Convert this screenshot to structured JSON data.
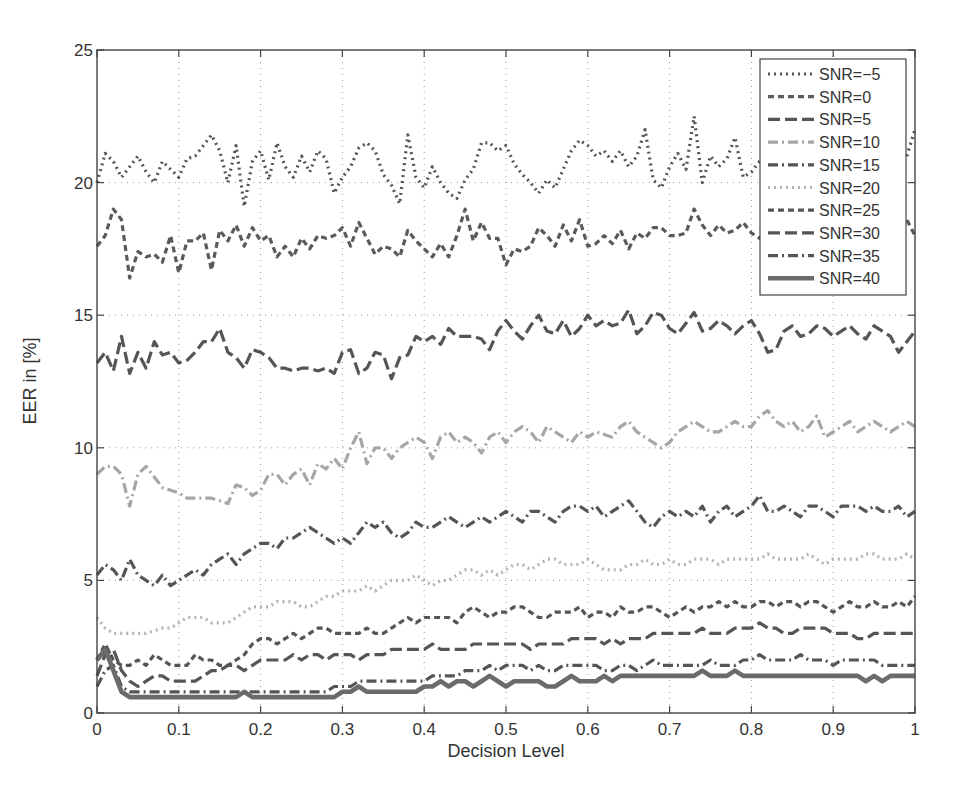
{
  "chart_data": {
    "type": "line",
    "title": "",
    "xlabel": "Decision Level",
    "ylabel": "EER in [%]",
    "xlim": [
      0,
      1
    ],
    "ylim": [
      0,
      25
    ],
    "xticks": [
      0,
      0.1,
      0.2,
      0.3,
      0.4,
      0.5,
      0.6,
      0.7,
      0.8,
      0.9,
      1
    ],
    "xtick_labels": [
      "0",
      "0.1",
      "0.2",
      "0.3",
      "0.4",
      "0.5",
      "0.6",
      "0.7",
      "0.8",
      "0.9",
      "1"
    ],
    "yticks": [
      0,
      5,
      10,
      15,
      20,
      25
    ],
    "ytick_labels": [
      "0",
      "5",
      "10",
      "15",
      "20",
      "25"
    ],
    "grid": true,
    "grid_style": "dotted",
    "legend_position": "upper right",
    "x_step": 0.01,
    "series": [
      {
        "name": "SNR=-5",
        "label": "SNR=−5",
        "color": "#555555",
        "width": 3.2,
        "dash": "2 4",
        "values": [
          20.0,
          21.1,
          20.8,
          20.2,
          20.6,
          21.0,
          20.4,
          20.0,
          20.8,
          20.5,
          20.2,
          20.9,
          21.0,
          21.4,
          21.8,
          21.2,
          20.0,
          21.4,
          19.1,
          20.8,
          21.2,
          20.1,
          21.5,
          20.6,
          20.2,
          21.0,
          20.4,
          21.2,
          20.9,
          19.6,
          20.2,
          20.6,
          21.3,
          21.5,
          21.2,
          20.3,
          19.9,
          19.2,
          21.8,
          20.2,
          19.8,
          20.6,
          20.0,
          19.6,
          19.4,
          20.1,
          20.5,
          21.5,
          21.5,
          21.2,
          21.4,
          20.7,
          20.3,
          20.0,
          19.6,
          20.1,
          19.8,
          20.5,
          21.2,
          21.6,
          21.4,
          21.0,
          21.2,
          20.8,
          21.2,
          20.6,
          21.0,
          22.0,
          20.1,
          19.8,
          20.6,
          21.1,
          20.5,
          22.5,
          20.0,
          21.0,
          20.6,
          20.9,
          21.7,
          20.2,
          20.4,
          20.8,
          21.0,
          20.2,
          19.8,
          21.2,
          20.6,
          20.0,
          21.5,
          20.4,
          20.6,
          20.2,
          21.3,
          20.5,
          19.8,
          20.2,
          21.0,
          20.8,
          20.4,
          21.0,
          22.0
        ]
      },
      {
        "name": "SNR=0",
        "label": "SNR=0",
        "color": "#5a5a5a",
        "width": 3.2,
        "dash": "6 4",
        "values": [
          17.6,
          18.0,
          19.0,
          18.6,
          16.4,
          17.4,
          17.2,
          17.3,
          17.0,
          18.0,
          16.6,
          17.8,
          17.8,
          18.1,
          16.7,
          18.2,
          17.8,
          18.4,
          17.6,
          18.3,
          17.8,
          18.0,
          17.2,
          17.6,
          17.2,
          17.9,
          17.5,
          18.0,
          17.9,
          18.0,
          18.3,
          17.6,
          18.5,
          17.9,
          17.3,
          17.6,
          17.5,
          17.2,
          18.2,
          17.8,
          17.5,
          17.2,
          17.7,
          17.2,
          18.0,
          19.0,
          17.8,
          18.5,
          17.9,
          17.9,
          16.9,
          17.5,
          17.4,
          17.6,
          18.3,
          18.0,
          17.6,
          18.4,
          17.8,
          18.6,
          17.6,
          17.7,
          18.0,
          17.7,
          18.2,
          17.5,
          18.1,
          17.9,
          18.3,
          18.3,
          18.0,
          18.0,
          18.1,
          19.0,
          18.4,
          18.0,
          18.4,
          18.1,
          18.2,
          18.5,
          18.1,
          17.9,
          18.3,
          18.6,
          18.0,
          17.6,
          18.0,
          18.2,
          17.5,
          18.6,
          18.1,
          17.8,
          18.2,
          18.0,
          17.6,
          18.0,
          18.4,
          18.2,
          18.0,
          18.6,
          18.0
        ]
      },
      {
        "name": "SNR=5",
        "label": "SNR=5",
        "color": "#555555",
        "width": 3.2,
        "dash": "12 5",
        "values": [
          13.2,
          13.6,
          12.9,
          14.2,
          12.8,
          13.6,
          13.0,
          14.0,
          13.5,
          13.6,
          13.2,
          13.3,
          13.6,
          14.0,
          14.0,
          14.5,
          13.6,
          13.4,
          13.0,
          13.7,
          13.6,
          13.4,
          13.0,
          13.0,
          12.9,
          13.0,
          13.0,
          12.9,
          13.0,
          12.8,
          13.6,
          13.7,
          12.8,
          13.0,
          13.6,
          13.5,
          12.6,
          13.4,
          13.5,
          14.2,
          14.0,
          14.2,
          13.9,
          14.5,
          14.2,
          14.2,
          14.2,
          14.1,
          13.7,
          14.4,
          14.8,
          14.4,
          14.1,
          14.6,
          15.0,
          14.4,
          14.3,
          14.8,
          14.2,
          14.5,
          15.0,
          14.6,
          14.8,
          14.6,
          14.7,
          15.2,
          14.3,
          14.6,
          15.1,
          15.0,
          14.5,
          14.3,
          14.7,
          15.1,
          14.4,
          14.5,
          14.8,
          14.6,
          14.3,
          14.6,
          14.8,
          14.3,
          13.6,
          13.7,
          14.4,
          14.6,
          14.2,
          14.3,
          14.6,
          14.5,
          14.2,
          14.4,
          14.6,
          14.3,
          14.1,
          14.6,
          14.4,
          14.2,
          13.6,
          14.0,
          14.4
        ]
      },
      {
        "name": "SNR=10",
        "label": "SNR=10",
        "color": "#a6a6a6",
        "width": 3.2,
        "dash": "10 4 2 4",
        "values": [
          9.0,
          9.3,
          9.3,
          9.0,
          7.8,
          9.0,
          9.3,
          8.9,
          8.5,
          8.4,
          8.3,
          8.1,
          8.1,
          8.1,
          8.1,
          8.0,
          7.9,
          8.6,
          8.5,
          8.2,
          8.4,
          9.0,
          9.0,
          8.6,
          9.0,
          9.2,
          8.6,
          9.4,
          9.2,
          9.6,
          9.2,
          10.0,
          10.6,
          9.4,
          10.0,
          10.0,
          9.6,
          10.0,
          10.2,
          10.4,
          10.2,
          9.6,
          10.4,
          10.6,
          10.2,
          10.4,
          10.2,
          9.8,
          10.4,
          10.6,
          10.2,
          10.6,
          10.8,
          10.6,
          10.2,
          10.8,
          10.6,
          10.4,
          10.2,
          10.6,
          10.4,
          10.6,
          10.5,
          10.4,
          10.8,
          11.0,
          10.6,
          10.4,
          10.2,
          10.0,
          10.2,
          10.6,
          10.8,
          11.0,
          10.8,
          10.6,
          10.6,
          10.8,
          11.0,
          10.8,
          10.8,
          11.2,
          11.4,
          11.0,
          10.8,
          11.0,
          10.6,
          10.8,
          11.2,
          10.4,
          10.6,
          10.8,
          11.0,
          10.6,
          10.8,
          11.0,
          10.8,
          10.6,
          10.8,
          11.0,
          10.8
        ]
      },
      {
        "name": "SNR=15",
        "label": "SNR=15",
        "color": "#555555",
        "width": 3.2,
        "dash": "10 4 2 4",
        "values": [
          5.2,
          5.6,
          5.4,
          5.0,
          5.8,
          5.2,
          5.0,
          4.8,
          5.2,
          4.8,
          5.0,
          5.2,
          5.4,
          5.2,
          5.6,
          5.8,
          6.0,
          5.6,
          6.0,
          6.2,
          6.4,
          6.4,
          6.2,
          6.6,
          6.6,
          6.8,
          7.0,
          6.8,
          6.6,
          6.4,
          6.6,
          6.4,
          6.8,
          7.2,
          7.0,
          7.2,
          6.8,
          6.6,
          6.8,
          7.2,
          7.0,
          7.0,
          7.2,
          7.4,
          7.2,
          7.0,
          7.2,
          7.4,
          7.2,
          7.4,
          7.6,
          7.4,
          7.2,
          7.6,
          7.6,
          7.4,
          7.2,
          7.6,
          7.8,
          7.8,
          7.6,
          7.8,
          7.4,
          7.6,
          7.8,
          8.0,
          7.6,
          7.2,
          7.0,
          7.4,
          7.6,
          7.4,
          7.6,
          7.4,
          7.8,
          7.2,
          7.6,
          7.8,
          7.4,
          7.6,
          7.8,
          8.2,
          7.6,
          7.6,
          7.8,
          7.6,
          7.4,
          7.8,
          7.8,
          7.6,
          7.4,
          7.8,
          7.8,
          7.8,
          7.6,
          7.8,
          7.6,
          7.6,
          7.8,
          7.4,
          7.6
        ]
      },
      {
        "name": "SNR=20",
        "label": "SNR=20",
        "color": "#b3b3b3",
        "width": 3.2,
        "dash": "2 4",
        "values": [
          3.6,
          3.2,
          3.0,
          3.0,
          3.0,
          3.0,
          3.0,
          3.1,
          3.2,
          3.2,
          3.4,
          3.6,
          3.6,
          3.6,
          3.4,
          3.4,
          3.4,
          3.6,
          3.8,
          4.0,
          4.0,
          4.0,
          4.2,
          4.2,
          4.2,
          4.0,
          4.0,
          4.2,
          4.4,
          4.4,
          4.6,
          4.6,
          4.6,
          4.8,
          4.6,
          4.8,
          5.0,
          5.0,
          5.0,
          5.2,
          5.0,
          4.8,
          5.0,
          5.0,
          5.2,
          5.4,
          5.4,
          5.2,
          5.4,
          5.2,
          5.4,
          5.6,
          5.6,
          5.4,
          5.6,
          5.8,
          5.8,
          5.6,
          5.6,
          5.6,
          5.8,
          5.6,
          5.4,
          5.4,
          5.4,
          5.6,
          5.6,
          5.8,
          5.6,
          5.6,
          5.8,
          5.6,
          5.6,
          5.8,
          5.8,
          5.8,
          5.6,
          5.8,
          5.8,
          5.8,
          5.8,
          5.8,
          6.0,
          5.8,
          5.8,
          5.8,
          5.8,
          6.0,
          5.8,
          5.6,
          5.8,
          5.8,
          5.8,
          5.8,
          6.0,
          6.0,
          5.8,
          5.8,
          5.8,
          6.0,
          5.8
        ]
      },
      {
        "name": "SNR=25",
        "label": "SNR=25",
        "color": "#555555",
        "width": 3.2,
        "dash": "6 4",
        "values": [
          2.0,
          2.6,
          2.0,
          1.8,
          1.8,
          2.0,
          1.8,
          2.2,
          2.0,
          1.8,
          1.8,
          1.8,
          2.2,
          2.0,
          2.0,
          1.8,
          1.8,
          2.0,
          2.2,
          2.6,
          2.8,
          2.8,
          2.6,
          2.8,
          3.0,
          2.8,
          3.0,
          3.2,
          3.2,
          3.0,
          3.0,
          3.0,
          3.0,
          3.2,
          3.0,
          3.0,
          3.2,
          3.4,
          3.6,
          3.4,
          3.6,
          3.6,
          3.6,
          3.6,
          3.4,
          3.8,
          4.0,
          3.8,
          3.6,
          3.8,
          3.8,
          4.0,
          4.0,
          3.8,
          3.6,
          3.6,
          3.8,
          3.8,
          3.8,
          4.0,
          3.6,
          3.8,
          3.8,
          3.6,
          4.0,
          3.8,
          3.8,
          4.0,
          4.0,
          3.8,
          3.6,
          3.8,
          4.0,
          3.8,
          4.0,
          4.0,
          4.2,
          4.0,
          4.2,
          4.0,
          4.0,
          4.2,
          4.2,
          4.0,
          4.2,
          4.2,
          4.0,
          4.2,
          4.2,
          4.0,
          3.8,
          4.0,
          4.2,
          4.0,
          4.0,
          4.2,
          4.0,
          4.0,
          4.2,
          4.0,
          4.4
        ]
      },
      {
        "name": "SNR=30",
        "label": "SNR=30",
        "color": "#555555",
        "width": 3.2,
        "dash": "12 5",
        "values": [
          1.4,
          2.2,
          2.4,
          1.6,
          1.2,
          1.0,
          1.2,
          1.4,
          1.4,
          1.2,
          1.2,
          1.2,
          1.2,
          1.4,
          1.6,
          1.6,
          1.8,
          1.8,
          1.6,
          1.8,
          2.0,
          2.0,
          2.0,
          2.0,
          2.2,
          2.0,
          2.2,
          2.2,
          2.0,
          2.2,
          2.2,
          2.2,
          2.0,
          2.2,
          2.2,
          2.2,
          2.4,
          2.4,
          2.4,
          2.4,
          2.4,
          2.6,
          2.4,
          2.4,
          2.4,
          2.4,
          2.6,
          2.6,
          2.6,
          2.6,
          2.6,
          2.6,
          2.6,
          2.4,
          2.6,
          2.6,
          2.6,
          2.6,
          2.8,
          2.8,
          2.8,
          2.8,
          2.6,
          2.8,
          2.6,
          2.8,
          2.8,
          2.8,
          3.0,
          3.0,
          3.0,
          3.0,
          3.0,
          3.0,
          3.2,
          3.0,
          3.0,
          3.0,
          3.2,
          3.2,
          3.2,
          3.4,
          3.2,
          3.2,
          3.0,
          3.0,
          3.2,
          3.2,
          3.2,
          3.2,
          3.0,
          3.0,
          3.0,
          2.8,
          2.8,
          3.0,
          3.0,
          3.0,
          3.0,
          3.0,
          3.0
        ]
      },
      {
        "name": "SNR=35",
        "label": "SNR=35",
        "color": "#555555",
        "width": 3.2,
        "dash": "10 4 2 4",
        "values": [
          1.0,
          1.6,
          1.8,
          1.0,
          0.8,
          0.8,
          0.8,
          0.8,
          0.8,
          0.8,
          0.8,
          0.8,
          0.8,
          0.8,
          0.8,
          0.8,
          0.8,
          0.8,
          0.8,
          0.8,
          0.8,
          0.8,
          0.8,
          0.8,
          0.8,
          0.8,
          0.8,
          0.8,
          0.8,
          1.0,
          1.0,
          1.0,
          1.2,
          1.2,
          1.2,
          1.2,
          1.2,
          1.2,
          1.2,
          1.2,
          1.2,
          1.4,
          1.4,
          1.4,
          1.4,
          1.6,
          1.6,
          1.6,
          1.8,
          1.6,
          1.8,
          1.8,
          1.8,
          1.6,
          1.8,
          1.6,
          1.6,
          1.8,
          1.8,
          1.8,
          1.8,
          1.8,
          1.6,
          1.6,
          1.8,
          1.8,
          1.6,
          1.8,
          2.0,
          1.8,
          1.8,
          1.8,
          1.8,
          1.8,
          1.8,
          2.0,
          1.8,
          1.8,
          1.8,
          2.0,
          2.0,
          2.2,
          2.0,
          2.0,
          2.0,
          2.0,
          2.2,
          2.0,
          2.0,
          2.0,
          1.8,
          2.0,
          2.0,
          2.0,
          2.0,
          2.0,
          1.8,
          1.8,
          1.8,
          1.8,
          1.8
        ]
      },
      {
        "name": "SNR=40",
        "label": "SNR=40",
        "color": "#6b6b6b",
        "width": 4.6,
        "dash": "",
        "values": [
          2.0,
          2.4,
          1.6,
          0.8,
          0.6,
          0.6,
          0.6,
          0.6,
          0.6,
          0.6,
          0.6,
          0.6,
          0.6,
          0.6,
          0.6,
          0.6,
          0.6,
          0.6,
          0.8,
          0.6,
          0.6,
          0.6,
          0.6,
          0.6,
          0.6,
          0.6,
          0.6,
          0.6,
          0.6,
          0.6,
          0.8,
          0.8,
          1.0,
          0.8,
          0.8,
          0.8,
          0.8,
          0.8,
          0.8,
          0.8,
          1.0,
          1.0,
          1.2,
          1.0,
          1.2,
          1.2,
          1.0,
          1.2,
          1.4,
          1.2,
          1.0,
          1.2,
          1.2,
          1.2,
          1.2,
          1.0,
          1.0,
          1.2,
          1.4,
          1.2,
          1.2,
          1.2,
          1.4,
          1.2,
          1.4,
          1.4,
          1.4,
          1.4,
          1.4,
          1.4,
          1.4,
          1.4,
          1.4,
          1.4,
          1.6,
          1.4,
          1.4,
          1.4,
          1.6,
          1.4,
          1.4,
          1.4,
          1.4,
          1.4,
          1.4,
          1.4,
          1.4,
          1.4,
          1.4,
          1.4,
          1.4,
          1.4,
          1.4,
          1.4,
          1.2,
          1.4,
          1.2,
          1.4,
          1.4,
          1.4,
          1.4
        ]
      }
    ]
  },
  "legend": {
    "title": ""
  }
}
